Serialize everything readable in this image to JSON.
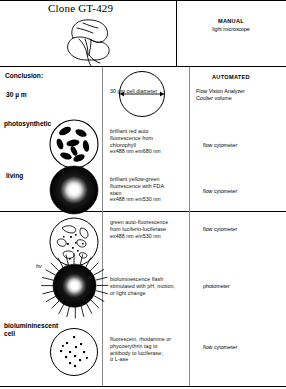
{
  "title": "Clone GT-429",
  "columns": {
    "manual": {
      "heading": "MANUAL",
      "sub": "light microscope"
    },
    "automated": {
      "heading": "AUTOMATED"
    }
  },
  "conclusion_label": "Conclusion:",
  "rows": [
    {
      "left_label": "30  µ m",
      "figure": "circle-with-diameter-arrow",
      "middle": "30 µm cell diameter",
      "right": "Flow Vision Analyzer\nCoulter volume"
    },
    {
      "left_label": "photosynthetic",
      "figure": "cell-with-chloroplasts",
      "middle": "brilliant red auto\nfluorescence from\nchlorophyll\n  ex488 nm  em680 nm",
      "right": "flow cytometer"
    },
    {
      "left_label": "living",
      "figure": "dark-cell-bright-center",
      "middle": "brilliant yellow-green\nfluorescence with FDA\nstain\n  ex488 nm  em530 nm",
      "right": "flow cytometer"
    },
    {
      "left_label": "",
      "figure": "cell-with-speckles",
      "middle": "green auto-fluorescence\nfrom luciferin-luciferase\n  ex488 nm  em530 nm",
      "right": "flow cytometer"
    },
    {
      "left_label": "",
      "figure": "flashing-cell-with-rays",
      "annotation": "hν",
      "middle": "bioluminescence flash\nstimulated with pH, motion,\nor light change",
      "right": "photometer"
    },
    {
      "left_label": "biolumininescent\ncell",
      "figure": "cell-with-dots",
      "middle": "fluorescein, rhodamine or\nphycoerythrin tag to\nantibody to luciferase;\n   α L-ase",
      "right": "flow cytometer"
    }
  ],
  "colors": {
    "ink": "#000000",
    "paper": "#ffffff",
    "rule_light": "#8a8a8a"
  }
}
